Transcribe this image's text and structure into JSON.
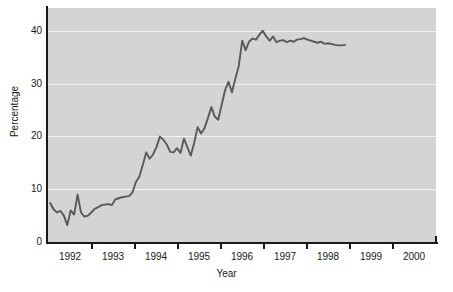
{
  "chart_data": {
    "type": "line",
    "title": "",
    "xlabel": "Year",
    "ylabel": "Percentage",
    "xlim": [
      1991.55,
      2000.6
    ],
    "ylim": [
      0,
      44.4
    ],
    "grid": true,
    "grid_color": "#f4f4f4",
    "panel_color": "#d4d4d4",
    "line_color": "#595959",
    "legend": "none",
    "yticks": [
      0,
      10,
      20,
      30,
      40
    ],
    "ytick_labels": [
      "0",
      "10",
      "20",
      "30",
      "40"
    ],
    "xticks": [
      1992.5,
      1993.5,
      1994.5,
      1995.5,
      1996.5,
      1997.5,
      1998.5,
      1999.5,
      2000.5
    ],
    "xtick_labels": [
      "1992",
      "1993",
      "1994",
      "1995",
      "1996",
      "1997",
      "1998",
      "1999",
      "2000"
    ],
    "xtick_label_positions": [
      1992,
      1993,
      1994,
      1995,
      1996,
      1997,
      1998,
      1999,
      2000
    ],
    "series": [
      {
        "name": "Percentage",
        "x": [
          1991.6,
          1991.68,
          1991.76,
          1991.84,
          1991.92,
          1992.0,
          1992.08,
          1992.16,
          1992.24,
          1992.32,
          1992.4,
          1992.48,
          1992.56,
          1992.64,
          1992.72,
          1992.8,
          1992.88,
          1992.96,
          1993.04,
          1993.12,
          1993.2,
          1993.28,
          1993.36,
          1993.44,
          1993.52,
          1993.6,
          1993.68,
          1993.76,
          1993.84,
          1993.92,
          1994.0,
          1994.08,
          1994.16,
          1994.24,
          1994.32,
          1994.4,
          1994.48,
          1994.56,
          1994.64,
          1994.72,
          1994.8,
          1994.88,
          1994.96,
          1995.04,
          1995.12,
          1995.2,
          1995.28,
          1995.36,
          1995.44,
          1995.52,
          1995.6,
          1995.68,
          1995.76,
          1995.84,
          1995.92,
          1996.0,
          1996.08,
          1996.16,
          1996.24,
          1996.32,
          1996.4,
          1996.48,
          1996.56,
          1996.64,
          1996.72,
          1996.8,
          1996.88,
          1996.96,
          1997.04,
          1997.12,
          1997.2,
          1997.28,
          1997.36,
          1997.44,
          1997.52,
          1997.6,
          1997.68,
          1997.76,
          1997.84,
          1997.92,
          1998.0,
          1998.08,
          1998.16,
          1998.24,
          1998.32,
          1998.4,
          1998.48
        ],
        "y": [
          7.4,
          6.2,
          5.6,
          5.9,
          5.0,
          3.2,
          6.0,
          5.2,
          9.0,
          5.6,
          4.8,
          5.0,
          5.6,
          6.3,
          6.6,
          7.0,
          7.1,
          7.2,
          7.0,
          8.1,
          8.3,
          8.5,
          8.6,
          8.7,
          9.4,
          11.4,
          12.4,
          14.6,
          17.0,
          15.8,
          16.6,
          18.0,
          20.0,
          19.4,
          18.5,
          17.1,
          17.0,
          17.8,
          16.9,
          19.6,
          18.0,
          16.4,
          18.8,
          21.8,
          20.6,
          21.6,
          23.5,
          25.6,
          23.8,
          23.2,
          26.0,
          28.8,
          30.4,
          28.4,
          31.0,
          33.4,
          38.2,
          36.4,
          38.0,
          38.6,
          38.4,
          39.3,
          40.1,
          39.0,
          38.2,
          39.0,
          37.9,
          38.2,
          38.3,
          37.9,
          38.2,
          38.0,
          38.4,
          38.5,
          38.7,
          38.4,
          38.2,
          38.0,
          37.8,
          38.0,
          37.6,
          37.7,
          37.6,
          37.4,
          37.3,
          37.3,
          37.4
        ]
      }
    ]
  }
}
